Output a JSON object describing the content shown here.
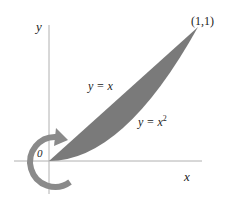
{
  "diagram": {
    "axes": {
      "x_label": "x",
      "y_label": "y",
      "origin_label": "0"
    },
    "point_label": "(1,1)",
    "curves": {
      "upper": {
        "label_prefix": "y = x",
        "label_sup": ""
      },
      "lower": {
        "label_prefix": "y = x",
        "label_sup": "2"
      }
    },
    "region": {
      "description": "area between y = x and y = x^2 from 0 to 1",
      "fill": "#7a7a7a"
    },
    "rotation_arrow": {
      "description": "circular arrow indicating revolution about origin",
      "color": "#8a8a8a"
    },
    "colors": {
      "axis": "#b0b0b0",
      "region": "#7a7a7a",
      "arrow": "#8a8a8a",
      "text": "#222222"
    }
  }
}
